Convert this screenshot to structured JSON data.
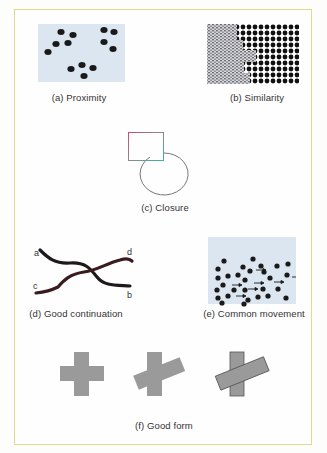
{
  "figure": {
    "panels": [
      {
        "id": "a",
        "caption": "(a) Proximity"
      },
      {
        "id": "b",
        "caption": "(b) Similarity"
      },
      {
        "id": "c",
        "caption": "(c) Closure"
      },
      {
        "id": "d",
        "caption": "(d) Good continuation",
        "endpoint_labels": [
          "a",
          "b",
          "c",
          "d"
        ]
      },
      {
        "id": "e",
        "caption": "(e) Common movement"
      },
      {
        "id": "f",
        "caption": "(f) Good form"
      }
    ]
  },
  "colors": {
    "frame_border": "#dcdc8a",
    "panel_bg": "#dce6f0",
    "dot": "#1a1a1a",
    "shape_gray": "#9a9a9a",
    "outline_gray": "#777777"
  }
}
